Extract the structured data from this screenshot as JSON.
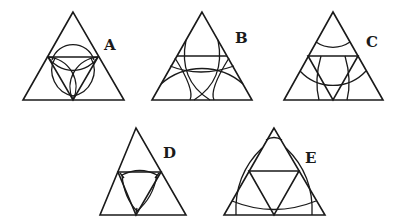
{
  "figure": {
    "panels": [
      {
        "label": "A",
        "caption": "Medial triangle with three inscribed arcs forming a trefoil"
      },
      {
        "label": "B",
        "caption": "Triangle with a horizontal chord and three large crossing arcs"
      },
      {
        "label": "C",
        "caption": "Triangle subdivided by a medial triangle and arcs centered at vertices"
      },
      {
        "label": "D",
        "caption": "Medial triangle with a concave Reuleaux-like curved triangle inside"
      },
      {
        "label": "E",
        "caption": "Medial triangle with three large arcs near the outer edges"
      }
    ]
  },
  "colors": {
    "stroke": "#1a1a1a",
    "background": "#ffffff"
  }
}
